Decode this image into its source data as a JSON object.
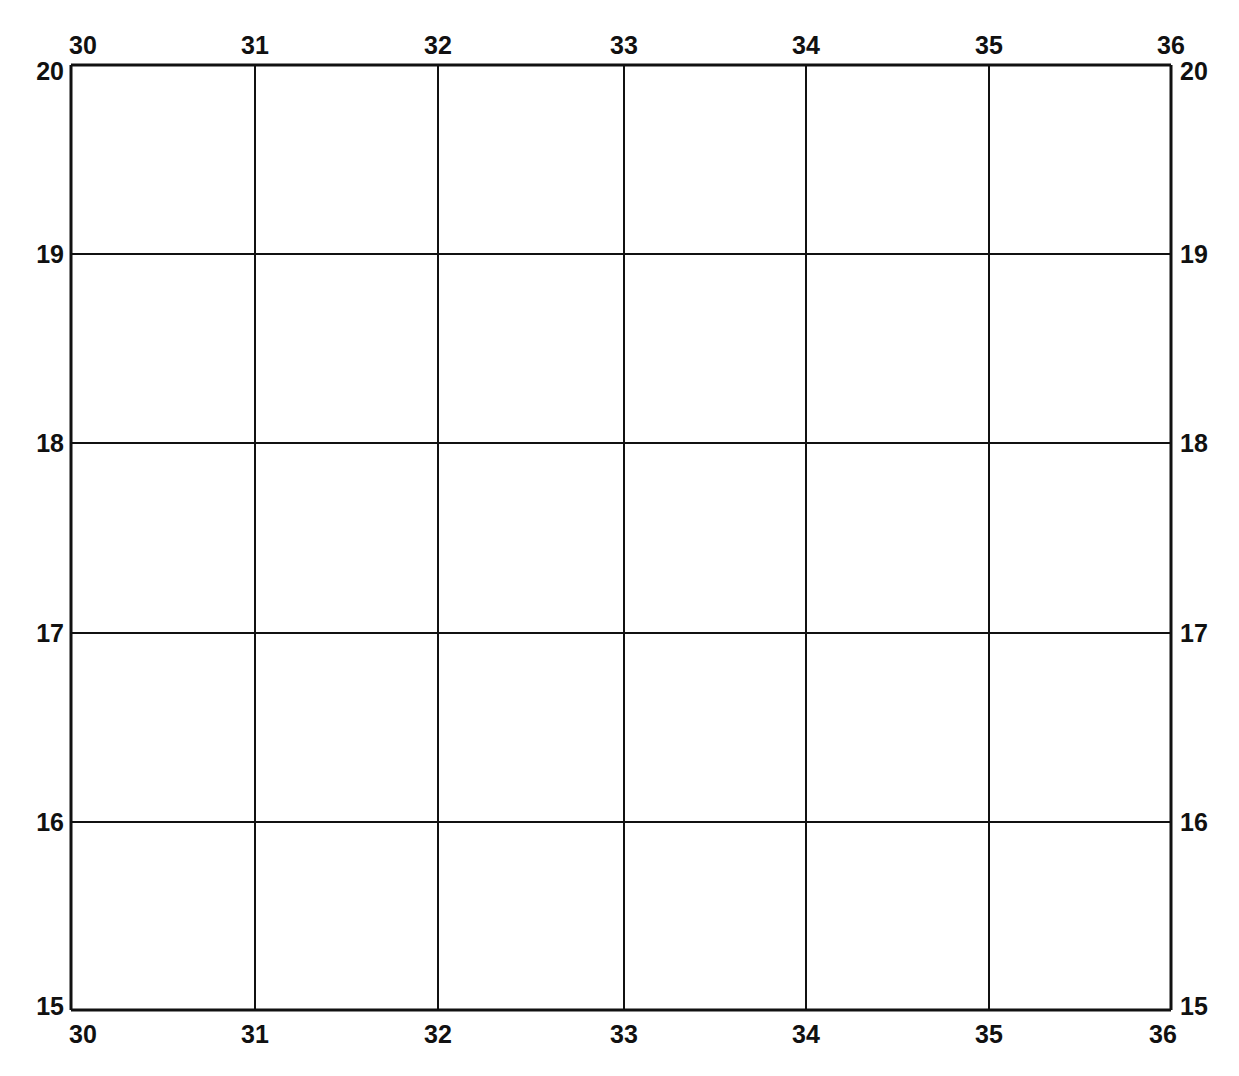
{
  "map": {
    "type": "graticule",
    "line_color": "#111111",
    "background": "#ffffff",
    "x_axis": {
      "name": "longitude",
      "ticks": [
        "30",
        "31",
        "32",
        "33",
        "34",
        "35",
        "36"
      ],
      "pixel_positions": [
        71,
        255,
        438,
        624,
        806,
        989,
        1171
      ]
    },
    "y_axis": {
      "name": "latitude",
      "ticks": [
        "20",
        "19",
        "18",
        "17",
        "16",
        "15"
      ],
      "pixel_positions": [
        65,
        254,
        443,
        633,
        822,
        1010
      ]
    },
    "labels": {
      "top": [
        "30",
        "31",
        "32",
        "33",
        "34",
        "35",
        "36"
      ],
      "bottom": [
        "30",
        "31",
        "32",
        "33",
        "34",
        "35",
        "36"
      ],
      "left": [
        "20",
        "19",
        "18",
        "17",
        "16",
        "15"
      ],
      "right": [
        "20",
        "19",
        "18",
        "17",
        "16",
        "15"
      ]
    }
  }
}
